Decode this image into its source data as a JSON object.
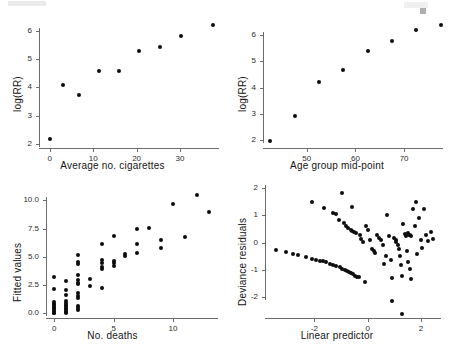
{
  "figure": {
    "layout": "2x2 grid of scatter plots",
    "panel_count": 4
  },
  "panels": [
    {
      "id": "log-rr-vs-cigarettes",
      "xlabel": "Average no. cigarettes",
      "ylabel": "log(RR)",
      "xticks": [
        "0",
        "10",
        "20",
        "30"
      ],
      "yticks": [
        "2",
        "3",
        "4",
        "5",
        "6"
      ]
    },
    {
      "id": "log-rr-vs-age",
      "xlabel": "Age group mid-point",
      "ylabel": "log(RR)",
      "xticks": [
        "50",
        "60",
        "70"
      ],
      "yticks": [
        "2",
        "3",
        "4",
        "5",
        "6"
      ]
    },
    {
      "id": "fitted-vs-deaths",
      "xlabel": "No. deaths",
      "ylabel": "Fitted values",
      "xticks": [
        "0",
        "5",
        "10"
      ],
      "yticks": [
        "0.0",
        "2.5",
        "5.0",
        "7.5",
        "10.0"
      ]
    },
    {
      "id": "residuals-vs-linear-predictor",
      "xlabel": "Linear predictor",
      "ylabel": "Deviance residuals",
      "xticks": [
        "-2",
        "0",
        "2"
      ],
      "yticks": [
        "-2",
        "-1",
        "0",
        "1",
        "2"
      ]
    }
  ],
  "chart_data": [
    {
      "type": "scatter",
      "title": "",
      "xlabel": "Average no. cigarettes",
      "ylabel": "log(RR)",
      "xlim": [
        -2.5,
        39
      ],
      "ylim": [
        1.85,
        6.45
      ],
      "xticks": [
        0,
        10,
        20,
        30
      ],
      "yticks": [
        2,
        3,
        4,
        5,
        6
      ],
      "grid": false,
      "legend": "none",
      "marker": "filled-circle",
      "color": "#0d0d0d",
      "points": [
        {
          "x": 0.0,
          "y": 2.16
        },
        {
          "x": 3.0,
          "y": 4.08
        },
        {
          "x": 6.7,
          "y": 3.71
        },
        {
          "x": 11.3,
          "y": 4.58
        },
        {
          "x": 16.0,
          "y": 4.56
        },
        {
          "x": 20.5,
          "y": 5.27
        },
        {
          "x": 25.4,
          "y": 5.43
        },
        {
          "x": 30.3,
          "y": 5.83
        },
        {
          "x": 37.6,
          "y": 6.21
        }
      ]
    },
    {
      "type": "scatter",
      "title": "",
      "xlabel": "Age group mid-point",
      "ylabel": "log(RR)",
      "xlim": [
        41,
        78
      ],
      "ylim": [
        1.7,
        6.65
      ],
      "xticks": [
        50,
        60,
        70
      ],
      "yticks": [
        2,
        3,
        4,
        5,
        6
      ],
      "grid": false,
      "legend": "none",
      "marker": "filled-circle",
      "color": "#0d0d0d",
      "points": [
        {
          "x": 42.5,
          "y": 1.96
        },
        {
          "x": 47.5,
          "y": 2.92
        },
        {
          "x": 52.5,
          "y": 4.21
        },
        {
          "x": 57.5,
          "y": 4.68
        },
        {
          "x": 62.5,
          "y": 5.4
        },
        {
          "x": 67.5,
          "y": 5.77
        },
        {
          "x": 72.5,
          "y": 6.18
        },
        {
          "x": 77.5,
          "y": 6.37
        }
      ]
    },
    {
      "type": "scatter",
      "title": "",
      "xlabel": "No. deaths",
      "ylabel": "Fitted values",
      "xlim": [
        -0.7,
        13.8
      ],
      "ylim": [
        -0.4,
        10.9
      ],
      "xticks": [
        0,
        5,
        10
      ],
      "yticks": [
        0.0,
        2.5,
        5.0,
        7.5,
        10.0
      ],
      "grid": false,
      "legend": "none",
      "marker": "filled-circle",
      "color": "#0d0d0d",
      "points": [
        {
          "x": 0,
          "y": 3.25
        },
        {
          "x": 0,
          "y": 2.18
        },
        {
          "x": 0,
          "y": 1.02
        },
        {
          "x": 0,
          "y": 0.85
        },
        {
          "x": 0,
          "y": 0.72
        },
        {
          "x": 0,
          "y": 0.6
        },
        {
          "x": 0,
          "y": 0.48
        },
        {
          "x": 0,
          "y": 0.36
        },
        {
          "x": 0,
          "y": 0.24
        },
        {
          "x": 0,
          "y": 0.15
        },
        {
          "x": 0,
          "y": 0.06
        },
        {
          "x": 0,
          "y": 0.0
        },
        {
          "x": 1,
          "y": 2.86
        },
        {
          "x": 1,
          "y": 2.1
        },
        {
          "x": 1,
          "y": 1.62
        },
        {
          "x": 1,
          "y": 1.1
        },
        {
          "x": 1,
          "y": 0.92
        },
        {
          "x": 1,
          "y": 0.78
        },
        {
          "x": 1,
          "y": 0.62
        },
        {
          "x": 1,
          "y": 0.5
        },
        {
          "x": 1,
          "y": 0.38
        },
        {
          "x": 1,
          "y": 0.26
        },
        {
          "x": 1,
          "y": 0.14
        },
        {
          "x": 1,
          "y": 0.04
        },
        {
          "x": 2,
          "y": 5.12
        },
        {
          "x": 2,
          "y": 4.55
        },
        {
          "x": 2,
          "y": 4.38
        },
        {
          "x": 2,
          "y": 3.38
        },
        {
          "x": 2,
          "y": 2.95
        },
        {
          "x": 2,
          "y": 2.72
        },
        {
          "x": 2,
          "y": 2.58
        },
        {
          "x": 2,
          "y": 1.78
        },
        {
          "x": 2,
          "y": 1.55
        },
        {
          "x": 2,
          "y": 1.4
        },
        {
          "x": 2,
          "y": 0.7
        },
        {
          "x": 2,
          "y": 0.48
        },
        {
          "x": 2,
          "y": 0.32
        },
        {
          "x": 3,
          "y": 3.08
        },
        {
          "x": 3,
          "y": 2.4
        },
        {
          "x": 4,
          "y": 6.1
        },
        {
          "x": 4,
          "y": 4.72
        },
        {
          "x": 4,
          "y": 4.42
        },
        {
          "x": 4,
          "y": 4.1
        },
        {
          "x": 4,
          "y": 3.92
        },
        {
          "x": 4,
          "y": 2.25
        },
        {
          "x": 5,
          "y": 6.85
        },
        {
          "x": 5,
          "y": 4.62
        },
        {
          "x": 5,
          "y": 4.42
        },
        {
          "x": 5,
          "y": 4.22
        },
        {
          "x": 6,
          "y": 5.28
        },
        {
          "x": 6,
          "y": 5.08
        },
        {
          "x": 7,
          "y": 7.48
        },
        {
          "x": 7,
          "y": 6.1
        },
        {
          "x": 7,
          "y": 5.32
        },
        {
          "x": 8,
          "y": 7.55
        },
        {
          "x": 9,
          "y": 6.5
        },
        {
          "x": 9,
          "y": 5.78
        },
        {
          "x": 10,
          "y": 9.62
        },
        {
          "x": 11,
          "y": 6.72
        },
        {
          "x": 12,
          "y": 10.45
        },
        {
          "x": 13,
          "y": 9.0
        }
      ]
    },
    {
      "type": "scatter",
      "title": "",
      "xlabel": "Linear predictor",
      "ylabel": "Deviance residuals",
      "xlim": [
        -3.85,
        2.75
      ],
      "ylim": [
        -2.75,
        2.0
      ],
      "xticks": [
        -2,
        0,
        2
      ],
      "yticks": [
        -2,
        -1,
        0,
        1,
        2
      ],
      "grid": false,
      "legend": "none",
      "marker": "filled-circle",
      "color": "#0d0d0d",
      "points": [
        {
          "x": -3.45,
          "y": -0.26
        },
        {
          "x": -3.05,
          "y": -0.33
        },
        {
          "x": -2.8,
          "y": -0.42
        },
        {
          "x": -2.62,
          "y": -0.44
        },
        {
          "x": -2.3,
          "y": -0.52
        },
        {
          "x": -2.08,
          "y": -0.58
        },
        {
          "x": -1.92,
          "y": -0.62
        },
        {
          "x": -1.8,
          "y": -0.65
        },
        {
          "x": -1.68,
          "y": -0.68
        },
        {
          "x": -1.55,
          "y": -0.72
        },
        {
          "x": -1.42,
          "y": -0.76
        },
        {
          "x": -1.3,
          "y": -0.8
        },
        {
          "x": -1.18,
          "y": -0.84
        },
        {
          "x": -1.05,
          "y": -0.9
        },
        {
          "x": -0.95,
          "y": -0.95
        },
        {
          "x": -0.86,
          "y": -1.0
        },
        {
          "x": -0.78,
          "y": -1.04
        },
        {
          "x": -0.7,
          "y": -1.08
        },
        {
          "x": -0.62,
          "y": -1.12
        },
        {
          "x": -0.55,
          "y": -1.16
        },
        {
          "x": -0.48,
          "y": -1.2
        },
        {
          "x": -0.4,
          "y": -1.24
        },
        {
          "x": -0.33,
          "y": -1.27
        },
        {
          "x": -0.1,
          "y": -1.45
        },
        {
          "x": -2.08,
          "y": 1.5
        },
        {
          "x": -1.62,
          "y": 1.28
        },
        {
          "x": -1.3,
          "y": 1.1
        },
        {
          "x": -1.2,
          "y": 1.04
        },
        {
          "x": -1.08,
          "y": 0.82
        },
        {
          "x": -0.98,
          "y": 1.8
        },
        {
          "x": -0.88,
          "y": 0.72
        },
        {
          "x": -0.8,
          "y": 0.62
        },
        {
          "x": -0.72,
          "y": 0.55
        },
        {
          "x": -0.64,
          "y": 0.48
        },
        {
          "x": -0.58,
          "y": 0.42
        },
        {
          "x": -0.5,
          "y": 0.38
        },
        {
          "x": -0.42,
          "y": 0.34
        },
        {
          "x": -0.6,
          "y": 1.32
        },
        {
          "x": -0.3,
          "y": 0.3
        },
        {
          "x": -0.25,
          "y": 0.12
        },
        {
          "x": -0.18,
          "y": 0.04
        },
        {
          "x": -0.05,
          "y": 0.62
        },
        {
          "x": 0.02,
          "y": 0.48
        },
        {
          "x": 0.1,
          "y": 0.1
        },
        {
          "x": 0.18,
          "y": -0.22
        },
        {
          "x": 0.22,
          "y": -0.3
        },
        {
          "x": 0.28,
          "y": -0.38
        },
        {
          "x": 0.34,
          "y": 0.3
        },
        {
          "x": 0.42,
          "y": 0.18
        },
        {
          "x": 0.5,
          "y": 0.1
        },
        {
          "x": 0.58,
          "y": -0.08
        },
        {
          "x": 0.62,
          "y": -0.78
        },
        {
          "x": 0.7,
          "y": -0.48
        },
        {
          "x": 0.74,
          "y": 1.02
        },
        {
          "x": 0.8,
          "y": 0.26
        },
        {
          "x": 0.86,
          "y": -0.62
        },
        {
          "x": 0.9,
          "y": -1.28
        },
        {
          "x": 0.92,
          "y": -2.12
        },
        {
          "x": 1.0,
          "y": 0.18
        },
        {
          "x": 1.05,
          "y": 0.1
        },
        {
          "x": 1.08,
          "y": 0.02
        },
        {
          "x": 1.12,
          "y": -0.08
        },
        {
          "x": 1.16,
          "y": -0.22
        },
        {
          "x": 1.2,
          "y": -0.5
        },
        {
          "x": 1.24,
          "y": -0.8
        },
        {
          "x": 1.28,
          "y": -1.22
        },
        {
          "x": 1.3,
          "y": -2.6
        },
        {
          "x": 1.34,
          "y": 0.7
        },
        {
          "x": 1.4,
          "y": 0.32
        },
        {
          "x": 1.45,
          "y": 0.26
        },
        {
          "x": 1.5,
          "y": 0.34
        },
        {
          "x": 1.54,
          "y": 0.3
        },
        {
          "x": 1.58,
          "y": 0.28
        },
        {
          "x": 1.62,
          "y": 0.25
        },
        {
          "x": 1.48,
          "y": -0.3
        },
        {
          "x": 1.52,
          "y": -0.72
        },
        {
          "x": 1.58,
          "y": -0.95
        },
        {
          "x": 1.62,
          "y": -1.32
        },
        {
          "x": 1.7,
          "y": 1.22
        },
        {
          "x": 1.76,
          "y": 0.62
        },
        {
          "x": 1.82,
          "y": 1.48
        },
        {
          "x": 1.86,
          "y": -0.42
        },
        {
          "x": 1.92,
          "y": 0.92
        },
        {
          "x": 2.0,
          "y": 0.1
        },
        {
          "x": 2.05,
          "y": -0.18
        },
        {
          "x": 2.12,
          "y": 1.22
        },
        {
          "x": 2.2,
          "y": 0.3
        },
        {
          "x": 2.28,
          "y": 0.08
        },
        {
          "x": 2.38,
          "y": 0.4
        },
        {
          "x": 2.45,
          "y": 0.12
        }
      ]
    }
  ]
}
